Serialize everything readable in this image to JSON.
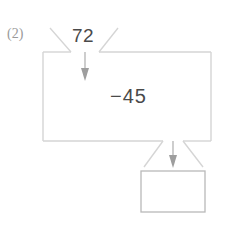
{
  "problem": {
    "number_label": "(2)",
    "input_value": "72",
    "operation": "−45",
    "result_value": ""
  },
  "colors": {
    "line": "#d5d5d5",
    "arrow": "#b0b0b0",
    "text": "#4a4a4a",
    "number_label": "#9a9a9a",
    "background": "#ffffff"
  },
  "icons": {
    "input_arrow": "arrow-down-icon",
    "output_arrow": "arrow-down-icon"
  },
  "labels": {
    "machine_box": "operation-machine",
    "answer_box": "answer-box"
  }
}
